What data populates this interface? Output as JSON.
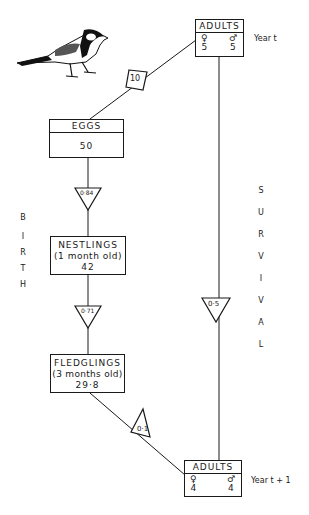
{
  "diagram": {
    "adults_year_t": {
      "title": "ADULTS",
      "female_symbol": "♀",
      "male_symbol": "♂",
      "female": "5",
      "male": "5",
      "year_label": "Year t"
    },
    "fecundity": {
      "value": "10"
    },
    "eggs": {
      "title": "EGGS",
      "value": "50"
    },
    "egg_survival": {
      "value": "0·84"
    },
    "nestlings": {
      "title": "NESTLINGS",
      "subtitle": "(1 month old)",
      "value": "42"
    },
    "nestling_survival": {
      "value": "0·71"
    },
    "fledglings": {
      "title": "FLEDGLINGS",
      "subtitle": "(3 months old)",
      "value": "29·8"
    },
    "fledgling_survival": {
      "value": "0·1"
    },
    "adult_survival": {
      "value": "0·5"
    },
    "adults_year_t1": {
      "title": "ADULTS",
      "female_symbol": "♀",
      "male_symbol": "♂",
      "female": "4",
      "male": "4",
      "year_label": "Year t + 1"
    },
    "birth_label": [
      "B",
      "I",
      "R",
      "T",
      "H"
    ],
    "survival_label": [
      "S",
      "U",
      "R",
      "V",
      "I",
      "V",
      "A",
      "L"
    ],
    "illustration": "great-tit-bird"
  }
}
